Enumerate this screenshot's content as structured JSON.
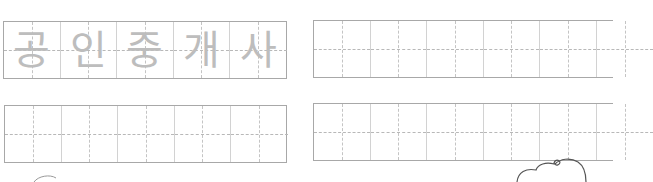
{
  "worksheet": {
    "rows": [
      {
        "boxes": [
          {
            "cells": [
              "공",
              "인",
              "중",
              "개",
              "사"
            ]
          },
          {
            "cells": [
              "",
              "",
              "",
              "",
              ""
            ]
          }
        ]
      },
      {
        "boxes": [
          {
            "cells": [
              "",
              "",
              "",
              "",
              ""
            ]
          },
          {
            "cells": [
              "",
              "",
              "",
              "",
              ""
            ]
          }
        ]
      }
    ],
    "trace_color": "#bdbdbd",
    "border_color": "#a8a8a8",
    "guide_color": "#c4c4c4"
  }
}
